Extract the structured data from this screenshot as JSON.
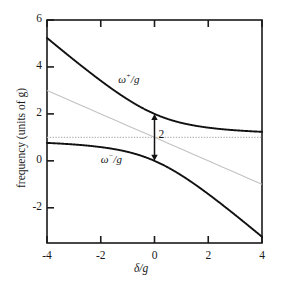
{
  "chart_data": {
    "type": "line",
    "title": "",
    "xlabel": "δ/g",
    "ylabel": "frequency (units of g)",
    "xlim": [
      -4,
      4
    ],
    "ylim": [
      -3.5,
      6
    ],
    "xticks": [
      -4,
      -2,
      0,
      2,
      4
    ],
    "xticklabels": [
      "-4",
      "-2",
      "0",
      "2",
      "4"
    ],
    "yticks": [
      -2,
      0,
      2,
      4,
      6
    ],
    "yticklabels": [
      "-2",
      "0",
      "2",
      "4",
      "6"
    ],
    "grid": false,
    "legend": "none",
    "x": [
      -4,
      -3.5,
      -3,
      -2.5,
      -2,
      -1.5,
      -1,
      -0.5,
      0,
      0.5,
      1,
      1.5,
      2,
      2.5,
      3,
      3.5,
      4
    ],
    "series": [
      {
        "name": "ω⁺/g",
        "style": "solid-black",
        "values": [
          5.236,
          4.808,
          4.303,
          3.851,
          3.414,
          3.003,
          2.618,
          2.28,
          2.0,
          1.78,
          1.618,
          1.5,
          1.414,
          1.351,
          1.303,
          1.266,
          1.236
        ]
      },
      {
        "name": "ω⁻/g",
        "style": "solid-black",
        "values": [
          0.764,
          0.693,
          0.697,
          0.649,
          0.586,
          0.497,
          0.382,
          0.22,
          0.0,
          -0.28,
          -0.618,
          -1.0,
          -1.414,
          -1.851,
          -2.303,
          -2.766,
          -3.236
        ]
      },
      {
        "name": "asymptote-diagonal",
        "style": "dotted-gray",
        "values": [
          3.0,
          2.75,
          2.5,
          2.25,
          2.0,
          1.75,
          1.5,
          1.25,
          1.0,
          0.75,
          0.5,
          0.25,
          0.0,
          -0.25,
          -0.5,
          -0.75,
          -1.0
        ]
      },
      {
        "name": "asymptote-horizontal",
        "style": "dotted-gray",
        "values": [
          1,
          1,
          1,
          1,
          1,
          1,
          1,
          1,
          1,
          1,
          1,
          1,
          1,
          1,
          1,
          1,
          1
        ]
      }
    ],
    "annotations": [
      {
        "name": "splitting-arrow",
        "label": "2",
        "x": 0,
        "y_from": 0.0,
        "y_to": 2.0,
        "arrow": "double-headed"
      },
      {
        "name": "upper-branch-label",
        "label": "ω⁺/g",
        "x": -1.35,
        "y": 3.45
      },
      {
        "name": "lower-branch-label",
        "label": "ω⁻/g",
        "x": -2.0,
        "y": 0.05
      }
    ],
    "colors": {
      "curve": "#111111",
      "asymptote": "#b9b9b9",
      "axis": "#1a1a1a",
      "annotation": "#111111",
      "background": "#ffffff"
    }
  },
  "axes": {
    "x_label_html": "δ/g",
    "y_label_text": "frequency (units of g)"
  },
  "labels": {
    "upper_omega": "ω",
    "upper_sup": "+",
    "upper_tail": "/g",
    "lower_omega": "ω",
    "lower_sup": "−",
    "lower_tail": "/g",
    "gap": "2"
  },
  "xtick_labels": {
    "t0": "-4",
    "t1": "-2",
    "t2": "0",
    "t3": "2",
    "t4": "4"
  },
  "ytick_labels": {
    "t0": "6",
    "t1": "4",
    "t2": "2",
    "t3": "0",
    "t4": "-2"
  }
}
